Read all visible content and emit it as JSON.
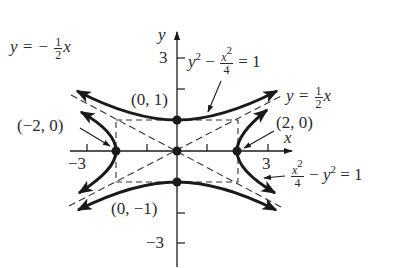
{
  "figure": {
    "type": "hyperbola-comparison",
    "axes": {
      "x_label": "x",
      "y_label": "y",
      "x_tick_labels": [
        "−3",
        "3"
      ],
      "y_tick_labels": [
        "3",
        "−3"
      ],
      "x_range": [
        -3.5,
        3.9
      ],
      "y_range": [
        -3.8,
        3.9
      ]
    },
    "curves": [
      {
        "name": "vertical-hyperbola",
        "equation": "y² − x²/4 = 1",
        "label_parts": {
          "y": "y",
          "y_exp": "2",
          "minus": "−",
          "num": "x",
          "num_exp": "2",
          "den": "4",
          "rhs": "= 1"
        }
      },
      {
        "name": "horizontal-hyperbola",
        "equation": "x²/4 − y² = 1",
        "label_parts": {
          "num": "x",
          "num_exp": "2",
          "den": "4",
          "minus": "−",
          "y": "y",
          "y_exp": "2",
          "rhs": "= 1"
        }
      }
    ],
    "asymptotes": [
      {
        "equation": "y = ½x",
        "label_parts": {
          "lhs": "y =",
          "num": "1",
          "den": "2",
          "var": "x"
        }
      },
      {
        "equation": "y = −½x",
        "label_parts": {
          "lhs": "y = −",
          "num": "1",
          "den": "2",
          "var": "x"
        }
      }
    ],
    "points": [
      {
        "label": "(0, 1)",
        "x": 0,
        "y": 1
      },
      {
        "label": "(−2, 0)",
        "x": -2,
        "y": 0
      },
      {
        "label": "(2, 0)",
        "x": 2,
        "y": 0
      },
      {
        "label": "(0, −1)",
        "x": 0,
        "y": -1
      },
      {
        "label": "",
        "x": 0,
        "y": 0
      }
    ],
    "colors": {
      "ink": "#1a1a1a",
      "text": "#2a2a2a",
      "background": "#ffffff"
    }
  }
}
